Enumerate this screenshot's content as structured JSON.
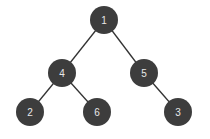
{
  "diagram": {
    "type": "binary-tree",
    "node_color": "#3d3d3d",
    "text_color": "#e8e8e8",
    "edge_color": "#333333",
    "radius": 14,
    "nodes": [
      {
        "id": "n1",
        "label": "1",
        "x": 104,
        "y": 20
      },
      {
        "id": "n4",
        "label": "4",
        "x": 62,
        "y": 73
      },
      {
        "id": "n5",
        "label": "5",
        "x": 144,
        "y": 73
      },
      {
        "id": "n2",
        "label": "2",
        "x": 30,
        "y": 112
      },
      {
        "id": "n6",
        "label": "6",
        "x": 97,
        "y": 112
      },
      {
        "id": "n3",
        "label": "3",
        "x": 178,
        "y": 112
      }
    ],
    "edges": [
      {
        "from": "n1",
        "to": "n4"
      },
      {
        "from": "n1",
        "to": "n5"
      },
      {
        "from": "n4",
        "to": "n2"
      },
      {
        "from": "n4",
        "to": "n6"
      },
      {
        "from": "n5",
        "to": "n3"
      }
    ]
  }
}
